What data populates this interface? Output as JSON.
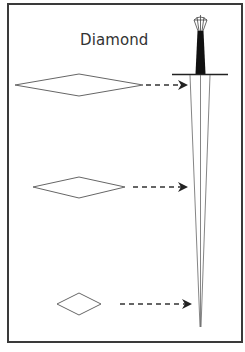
{
  "diagram": {
    "title": "Diamond",
    "cross_sections": [
      {
        "label": "near-guard",
        "shape": "diamond",
        "width": 128,
        "height": 22,
        "cx": 79,
        "cy": 85
      },
      {
        "label": "mid-blade",
        "shape": "diamond",
        "width": 92,
        "height": 21,
        "cx": 79,
        "cy": 187
      },
      {
        "label": "near-tip",
        "shape": "diamond",
        "width": 44,
        "height": 22,
        "cx": 79,
        "cy": 304
      }
    ],
    "arrows": [
      {
        "from_x": 146,
        "to_x": 186,
        "y": 85,
        "style": "dashed"
      },
      {
        "from_x": 133,
        "to_x": 186,
        "y": 187,
        "style": "dashed"
      },
      {
        "from_x": 120,
        "to_x": 190,
        "y": 304,
        "style": "dashed"
      }
    ],
    "sword": {
      "pommel": "faceted",
      "grip_color": "#111111",
      "crossguard_y": 74,
      "tip_y": 327
    },
    "colors": {
      "frame": "#3a3a3a",
      "lines": "#555555",
      "text": "#333333"
    }
  }
}
